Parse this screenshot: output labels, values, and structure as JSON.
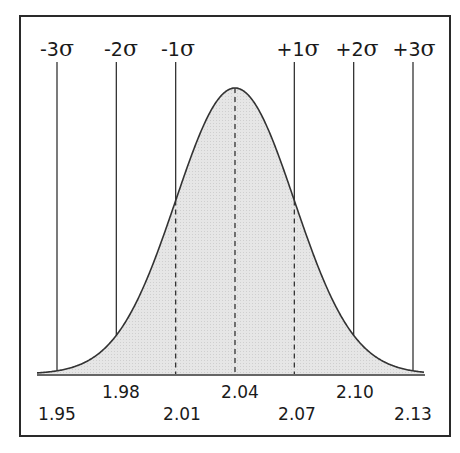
{
  "chart_data": {
    "type": "area",
    "title": "",
    "mean": 2.04,
    "std_dev": 0.03,
    "sigma_labels": [
      "-3σ",
      "-2σ",
      "-1σ",
      "+1σ",
      "+2σ",
      "+3σ"
    ],
    "sigma_values": [
      1.95,
      1.98,
      2.01,
      2.07,
      2.1,
      2.13
    ],
    "x_tick_labels": [
      "1.95",
      "1.98",
      "2.01",
      "2.04",
      "2.07",
      "2.10",
      "2.13"
    ],
    "x_ticks": [
      1.95,
      1.98,
      2.01,
      2.04,
      2.07,
      2.1,
      2.13
    ],
    "xlabel": "",
    "ylabel": "",
    "grid": false,
    "legend": false,
    "lines": {
      "sigma_markers": "solid vertical lines at ±1σ, ±2σ, ±3σ",
      "dashed_markers": "dashed vertical lines at -1σ, mean, +1σ under curve"
    },
    "colors": {
      "fill": "#e4e4e4",
      "stroke": "#333333",
      "frame": "#2a2a2a"
    }
  },
  "labels": {
    "sigma": [
      {
        "sign": "-3",
        "sym": "σ"
      },
      {
        "sign": "-2",
        "sym": "σ"
      },
      {
        "sign": "-1",
        "sym": "σ"
      },
      {
        "sign": "+1",
        "sym": "σ"
      },
      {
        "sign": "+2",
        "sym": "σ"
      },
      {
        "sign": "+3",
        "sym": "σ"
      }
    ],
    "ticks": [
      "1.95",
      "1.98",
      "2.01",
      "2.04",
      "2.07",
      "2.10",
      "2.13"
    ]
  }
}
